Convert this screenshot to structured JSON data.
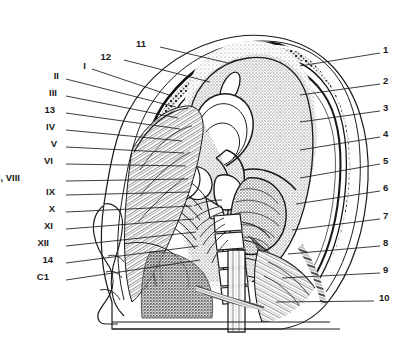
{
  "figure": {
    "type": "anatomical-illustration",
    "style": "black and white engraved line drawing with stipple shading",
    "background_color": "#ffffff",
    "line_color": "#1a1a1a",
    "label_color": "#1a1a1a"
  },
  "labels_left": [
    {
      "text": "I",
      "x": 86,
      "y": 66,
      "lx": 92,
      "ly": 69,
      "tx": 172,
      "ty": 96
    },
    {
      "text": "II",
      "x": 59,
      "y": 76,
      "lx": 66,
      "ly": 79,
      "tx": 176,
      "ty": 107
    },
    {
      "text": "III",
      "x": 57,
      "y": 93,
      "lx": 66,
      "ly": 96,
      "tx": 178,
      "ty": 118
    },
    {
      "text": "13",
      "x": 55,
      "y": 110,
      "lx": 66,
      "ly": 113,
      "tx": 180,
      "ty": 129
    },
    {
      "text": "IV",
      "x": 55,
      "y": 127,
      "lx": 66,
      "ly": 130,
      "tx": 182,
      "ty": 141
    },
    {
      "text": "V",
      "x": 57,
      "y": 144,
      "lx": 66,
      "ly": 147,
      "tx": 184,
      "ty": 153
    },
    {
      "text": "VI",
      "x": 53,
      "y": 161,
      "lx": 66,
      "ly": 164,
      "tx": 186,
      "ty": 166
    },
    {
      "text": "VII, VIII",
      "x": 20,
      "y": 178,
      "lx": 66,
      "ly": 181,
      "tx": 188,
      "ty": 179
    },
    {
      "text": "IX",
      "x": 55,
      "y": 192,
      "lx": 66,
      "ly": 195,
      "tx": 190,
      "ty": 192
    },
    {
      "text": "X",
      "x": 55,
      "y": 209,
      "lx": 66,
      "ly": 212,
      "tx": 192,
      "ty": 206
    },
    {
      "text": "XI",
      "x": 53,
      "y": 226,
      "lx": 66,
      "ly": 229,
      "tx": 194,
      "ty": 219
    },
    {
      "text": "XII",
      "x": 49,
      "y": 243,
      "lx": 66,
      "ly": 246,
      "tx": 196,
      "ty": 232
    },
    {
      "text": "14",
      "x": 53,
      "y": 260,
      "lx": 66,
      "ly": 263,
      "tx": 198,
      "ty": 246
    },
    {
      "text": "C1",
      "x": 49,
      "y": 277,
      "lx": 66,
      "ly": 280,
      "tx": 200,
      "ty": 260
    }
  ],
  "labels_right": [
    {
      "text": "1",
      "x": 383,
      "y": 50,
      "lx": 380,
      "ly": 53,
      "tx": 300,
      "ty": 66
    },
    {
      "text": "2",
      "x": 383,
      "y": 81,
      "lx": 380,
      "ly": 84,
      "tx": 300,
      "ty": 95
    },
    {
      "text": "3",
      "x": 383,
      "y": 108,
      "lx": 380,
      "ly": 111,
      "tx": 300,
      "ty": 122
    },
    {
      "text": "4",
      "x": 383,
      "y": 134,
      "lx": 380,
      "ly": 137,
      "tx": 300,
      "ty": 150
    },
    {
      "text": "5",
      "x": 383,
      "y": 161,
      "lx": 380,
      "ly": 164,
      "tx": 300,
      "ty": 178
    },
    {
      "text": "6",
      "x": 383,
      "y": 188,
      "lx": 380,
      "ly": 191,
      "tx": 296,
      "ty": 204
    },
    {
      "text": "7",
      "x": 383,
      "y": 216,
      "lx": 380,
      "ly": 219,
      "tx": 292,
      "ty": 230
    },
    {
      "text": "8",
      "x": 383,
      "y": 243,
      "lx": 380,
      "ly": 246,
      "tx": 288,
      "ty": 254
    },
    {
      "text": "9",
      "x": 383,
      "y": 270,
      "lx": 380,
      "ly": 273,
      "tx": 282,
      "ty": 278
    },
    {
      "text": "10",
      "x": 379,
      "y": 298,
      "lx": 374,
      "ly": 301,
      "tx": 276,
      "ty": 302
    }
  ],
  "labels_top": [
    {
      "text": "11",
      "x": 146,
      "y": 44,
      "lx": 160,
      "ly": 47,
      "tx": 228,
      "ty": 63
    },
    {
      "text": "12",
      "x": 111,
      "y": 57,
      "lx": 124,
      "ly": 60,
      "tx": 210,
      "ty": 82
    }
  ]
}
